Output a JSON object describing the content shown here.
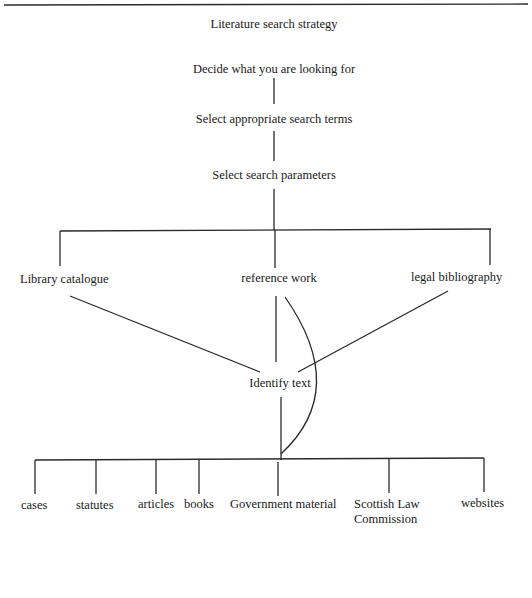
{
  "diagram": {
    "title": "Literature search strategy",
    "steps": [
      "Decide what you are looking for",
      "Select appropriate search terms",
      "Select search parameters"
    ],
    "sources": [
      "Library catalogue",
      "reference work",
      "legal bibliography"
    ],
    "identify": "Identify text",
    "materials": [
      "cases",
      "statutes",
      "articles",
      "books",
      "Government material",
      "Scottish Law Commission",
      "websites"
    ],
    "materials_display": {
      "scottish_line1": "Scottish Law",
      "scottish_line2": "Commission"
    }
  }
}
